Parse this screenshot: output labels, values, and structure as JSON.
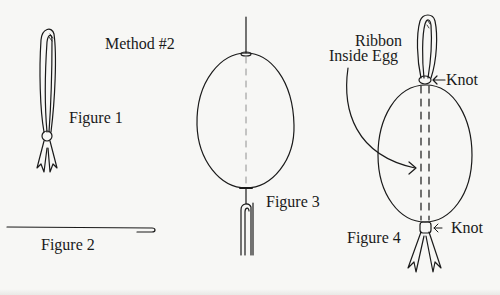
{
  "diagram": {
    "title": "Method #2",
    "figures": [
      {
        "id": "figure-1",
        "label": "Figure 1",
        "depicts": "ribbon loop tied with a knot, ends cut in notches"
      },
      {
        "id": "figure-2",
        "label": "Figure 2",
        "depicts": "long needle with hooked end"
      },
      {
        "id": "figure-3",
        "label": "Figure 3",
        "depicts": "egg with needle threaded through top and bottom, ribbon at bottom"
      },
      {
        "id": "figure-4",
        "label": "Figure 4",
        "depicts": "egg with ribbon inside, loop on top and ribbon ends at bottom, knots at both ends"
      }
    ],
    "annotations": {
      "ribbon_inside_line1": "Ribbon",
      "ribbon_inside_line2": "Inside Egg",
      "knot_top": "Knot",
      "knot_bottom": "Knot"
    },
    "colors": {
      "ink": "#1a1a1a",
      "paper": "#f7f7f5"
    }
  }
}
